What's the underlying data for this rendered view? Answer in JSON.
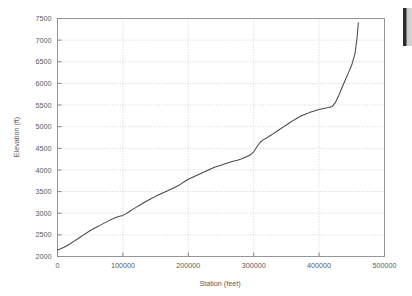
{
  "figure": {
    "background_color": "#ffffff",
    "frame_color": "#8c8c8c",
    "grid_color": "#b8b8b8",
    "line_color": "#4a4a4a",
    "width": 412,
    "height": 296
  },
  "chart_data": {
    "type": "line",
    "title": "",
    "subtitle": "",
    "xlabel": "Station (feet)",
    "ylabel": "Elevation (ft)",
    "xlim": [
      0,
      500000
    ],
    "ylim": [
      2000,
      7500
    ],
    "grid": true,
    "legend": false,
    "legend_position": "none",
    "xticks": [
      0,
      100000,
      200000,
      300000,
      400000,
      500000
    ],
    "xtick_labels": [
      "0",
      "100000",
      "200000",
      "300000",
      "400000",
      "500000"
    ],
    "yticks": [
      2000,
      2500,
      3000,
      3500,
      4000,
      4500,
      5000,
      5500,
      6000,
      6500,
      7000,
      7500
    ],
    "ytick_labels": [
      "2000",
      "2500",
      "3000",
      "3500",
      "4000",
      "4500",
      "5000",
      "5500",
      "6000",
      "6500",
      "7000",
      "7500"
    ],
    "series": [
      {
        "name": "Elevation profile",
        "color": "#4a4a4a",
        "x": [
          0,
          5000,
          10000,
          15000,
          20000,
          25000,
          30000,
          35000,
          40000,
          45000,
          50000,
          55000,
          60000,
          65000,
          70000,
          75000,
          80000,
          85000,
          90000,
          95000,
          100000,
          105000,
          110000,
          115000,
          120000,
          125000,
          130000,
          135000,
          140000,
          145000,
          150000,
          155000,
          160000,
          165000,
          170000,
          175000,
          180000,
          185000,
          190000,
          195000,
          200000,
          205000,
          210000,
          215000,
          220000,
          225000,
          230000,
          235000,
          240000,
          245000,
          250000,
          255000,
          260000,
          265000,
          270000,
          275000,
          280000,
          285000,
          290000,
          295000,
          300000,
          303000,
          306000,
          310000,
          315000,
          320000,
          325000,
          330000,
          335000,
          340000,
          345000,
          350000,
          355000,
          360000,
          365000,
          370000,
          375000,
          380000,
          385000,
          390000,
          395000,
          400000,
          405000,
          410000,
          415000,
          420000,
          425000,
          430000,
          435000,
          440000,
          445000,
          450000,
          455000,
          458000,
          460000
        ],
        "y": [
          2150,
          2180,
          2215,
          2255,
          2300,
          2350,
          2400,
          2450,
          2500,
          2550,
          2600,
          2640,
          2680,
          2720,
          2760,
          2800,
          2840,
          2875,
          2905,
          2930,
          2950,
          2990,
          3040,
          3090,
          3135,
          3180,
          3225,
          3270,
          3310,
          3350,
          3390,
          3425,
          3460,
          3495,
          3530,
          3565,
          3600,
          3640,
          3690,
          3740,
          3785,
          3820,
          3855,
          3890,
          3925,
          3960,
          3995,
          4030,
          4060,
          4085,
          4110,
          4135,
          4160,
          4185,
          4205,
          4225,
          4250,
          4280,
          4310,
          4350,
          4420,
          4490,
          4560,
          4640,
          4700,
          4740,
          4790,
          4840,
          4890,
          4940,
          4990,
          5040,
          5090,
          5140,
          5185,
          5230,
          5265,
          5295,
          5325,
          5350,
          5375,
          5395,
          5415,
          5430,
          5445,
          5465,
          5560,
          5720,
          5900,
          6080,
          6250,
          6430,
          6700,
          7050,
          7400
        ]
      }
    ]
  },
  "artifacts": {
    "right_edge_bar": "page-edge-artifact"
  }
}
